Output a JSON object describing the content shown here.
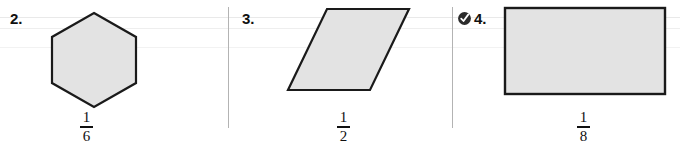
{
  "page": {
    "type": "math-worksheet-row"
  },
  "colors": {
    "shape_fill": "#e3e3e3",
    "shape_stroke": "#1a1a1a",
    "divider": "#b3b3b3",
    "text": "#101010",
    "page_background": "#ffffff"
  },
  "problems": [
    {
      "number": "2.",
      "marked": false,
      "marker_icon": "",
      "shape": "hexagon",
      "fraction": {
        "numerator": "1",
        "denominator": "6",
        "text": "1/6"
      }
    },
    {
      "number": "3.",
      "marked": false,
      "marker_icon": "",
      "shape": "parallelogram",
      "fraction": {
        "numerator": "1",
        "denominator": "2",
        "text": "1/2"
      }
    },
    {
      "number": "4.",
      "marked": true,
      "marker_icon": "circled-check-icon",
      "shape": "rectangle",
      "fraction": {
        "numerator": "1",
        "denominator": "8",
        "text": "1/8"
      }
    }
  ]
}
